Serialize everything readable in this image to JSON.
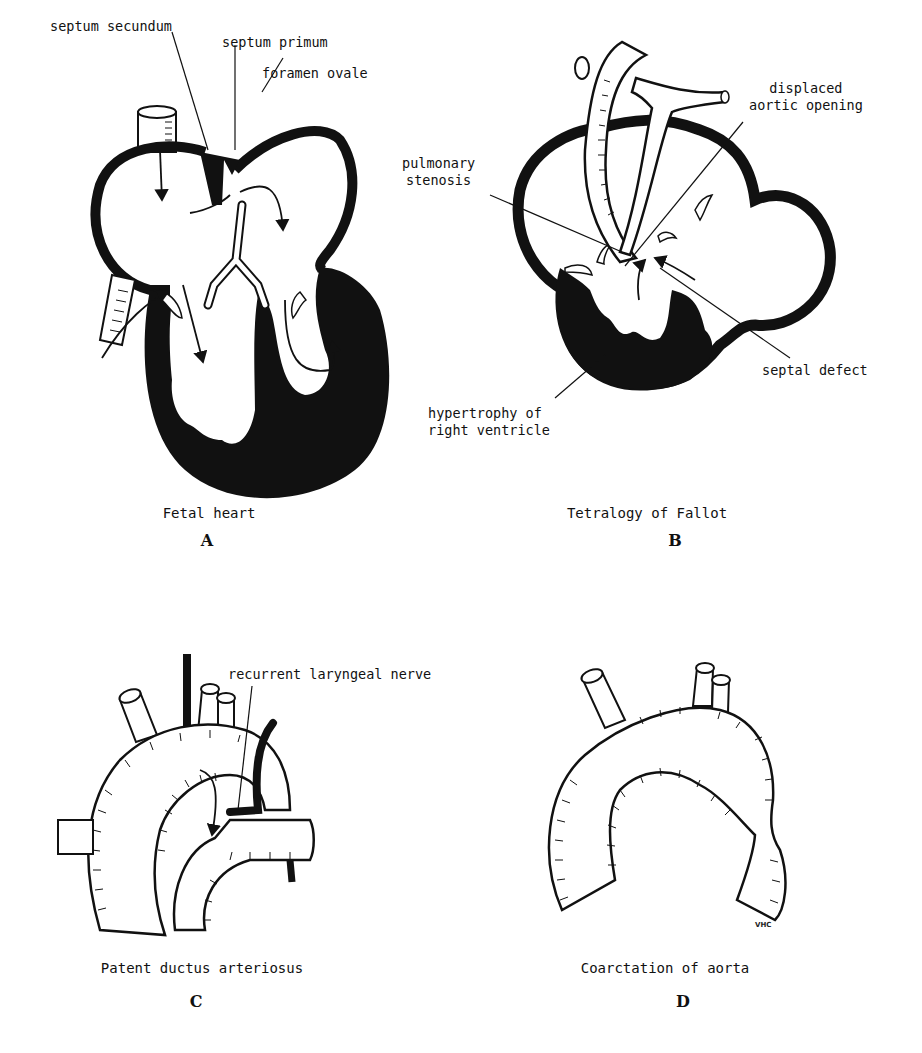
{
  "panels": [
    {
      "id": "A",
      "letter": "A",
      "caption": "Fetal heart",
      "labels": {
        "septum_secundum": "septum secundum",
        "septum_primum": "septum primum",
        "foramen_ovale": "foramen ovale"
      }
    },
    {
      "id": "B",
      "letter": "B",
      "caption": "Tetralogy of Fallot",
      "labels": {
        "displaced_aortic_opening": "displaced\naortic opening",
        "pulmonary_stenosis": "pulmonary\nstenosis",
        "septal_defect": "septal defect",
        "hypertrophy": "hypertrophy of\nright ventricle"
      }
    },
    {
      "id": "C",
      "letter": "C",
      "caption": "Patent ductus arteriosus",
      "labels": {
        "recurrent_laryngeal_nerve": "recurrent laryngeal nerve"
      }
    },
    {
      "id": "D",
      "letter": "D",
      "caption": "Coarctation of aorta",
      "signature": "VHC"
    }
  ],
  "colors": {
    "ink": "#111111",
    "paper": "#ffffff"
  }
}
